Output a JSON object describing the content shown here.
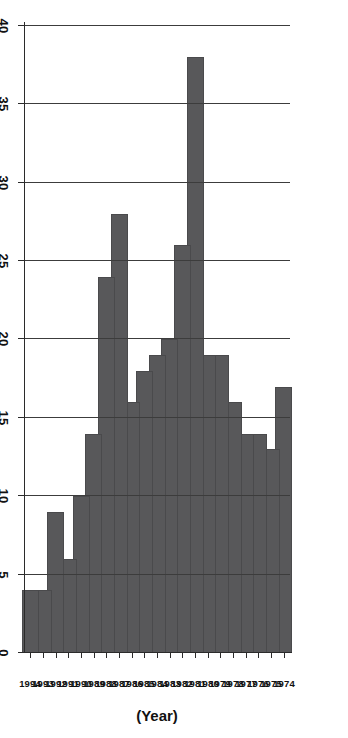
{
  "chart_data": {
    "type": "bar",
    "orientation": "vertical",
    "title": "",
    "subtitle": "",
    "xlabel": "(Year)",
    "ylabel": "No. of cases 10",
    "ylabel_superscript": "3",
    "categories": [
      "1974",
      "1975",
      "1976",
      "1977",
      "1978",
      "1979",
      "1980",
      "1981",
      "1982",
      "1983",
      "1984",
      "1985",
      "1986",
      "1987",
      "1988",
      "1989",
      "1990",
      "1991",
      "1992",
      "1993",
      "1994"
    ],
    "values": [
      17,
      13,
      14,
      14,
      16,
      19,
      19,
      38,
      26,
      20,
      19,
      18,
      16,
      28,
      24,
      14,
      10,
      6,
      9,
      4,
      4
    ],
    "ytick_labels": [
      "0",
      "5",
      "10",
      "15",
      "20",
      "25",
      "30",
      "35",
      "40"
    ],
    "ytick_values": [
      0,
      5,
      10,
      15,
      20,
      25,
      30,
      35,
      40
    ],
    "ylim": [
      0,
      40
    ],
    "grid": "value-axis-only",
    "legend": "none",
    "series": [
      {
        "name": "No. of cases",
        "color": "#58585a",
        "values": [
          17,
          13,
          14,
          14,
          16,
          19,
          19,
          38,
          26,
          20,
          19,
          18,
          16,
          28,
          24,
          14,
          10,
          6,
          9,
          4,
          4
        ]
      }
    ],
    "colors": {
      "bar": "#58585a",
      "bar_edge": "#4a4a4c",
      "gridline": "#3c3c3c",
      "axis": "#2b2b2b",
      "text": "#111111",
      "background": "#ffffff"
    },
    "page_rotation_degrees": -90
  }
}
